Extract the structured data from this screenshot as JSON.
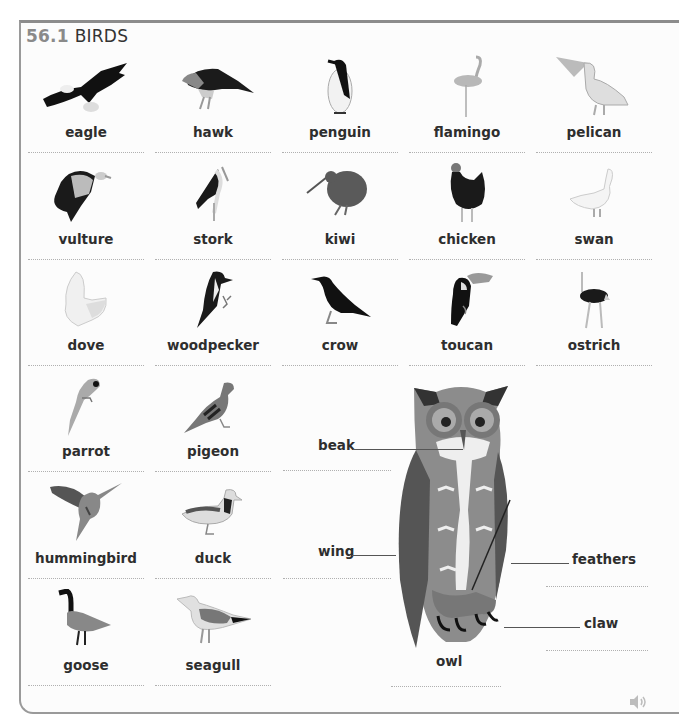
{
  "section": {
    "number": "56.1",
    "title": "BIRDS"
  },
  "colors": {
    "section_number": "#8a8a8a",
    "frame_border": "#9a9a9a",
    "text": "#2e2e2e",
    "dotted_line": "#b0b0b0"
  },
  "birds": [
    {
      "label": "eagle",
      "icon": "eagle-icon"
    },
    {
      "label": "hawk",
      "icon": "hawk-icon"
    },
    {
      "label": "penguin",
      "icon": "penguin-icon"
    },
    {
      "label": "flamingo",
      "icon": "flamingo-icon"
    },
    {
      "label": "pelican",
      "icon": "pelican-icon"
    },
    {
      "label": "vulture",
      "icon": "vulture-icon"
    },
    {
      "label": "stork",
      "icon": "stork-icon"
    },
    {
      "label": "kiwi",
      "icon": "kiwi-icon"
    },
    {
      "label": "chicken",
      "icon": "chicken-icon"
    },
    {
      "label": "swan",
      "icon": "swan-icon"
    },
    {
      "label": "dove",
      "icon": "dove-icon"
    },
    {
      "label": "woodpecker",
      "icon": "woodpecker-icon"
    },
    {
      "label": "crow",
      "icon": "crow-icon"
    },
    {
      "label": "toucan",
      "icon": "toucan-icon"
    },
    {
      "label": "ostrich",
      "icon": "ostrich-icon"
    },
    {
      "label": "parrot",
      "icon": "parrot-icon"
    },
    {
      "label": "pigeon",
      "icon": "pigeon-icon"
    },
    {
      "label": "hummingbird",
      "icon": "hummingbird-icon"
    },
    {
      "label": "duck",
      "icon": "duck-icon"
    },
    {
      "label": "goose",
      "icon": "goose-icon"
    },
    {
      "label": "seagull",
      "icon": "seagull-icon"
    }
  ],
  "owl": {
    "label": "owl",
    "parts": {
      "beak": "beak",
      "wing": "wing",
      "feathers": "feathers",
      "claw": "claw"
    }
  },
  "audio": {
    "icon": "speaker-icon"
  }
}
